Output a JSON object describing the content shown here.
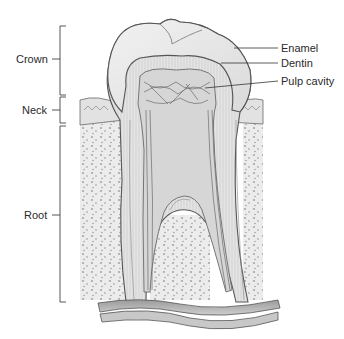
{
  "diagram": {
    "left_labels": [
      {
        "id": "crown",
        "text": "Crown"
      },
      {
        "id": "neck",
        "text": "Neck"
      },
      {
        "id": "root",
        "text": "Root"
      }
    ],
    "right_labels": [
      {
        "id": "enamel",
        "text": "Enamel"
      },
      {
        "id": "dentin",
        "text": "Dentin"
      },
      {
        "id": "pulp_cavity",
        "text": "Pulp cavity"
      }
    ]
  }
}
